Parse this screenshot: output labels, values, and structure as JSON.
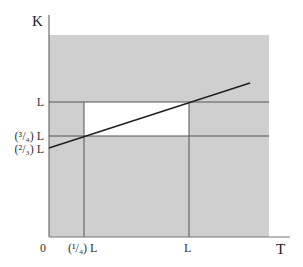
{
  "diagram": {
    "axes": {
      "y_label": "K",
      "x_label": "T",
      "origin_label": "0"
    },
    "y_ticks": [
      {
        "label": "L",
        "y": 102
      },
      {
        "label": "(³/₄) L",
        "y": 136
      },
      {
        "label": "(²/₃) L",
        "y": 148
      }
    ],
    "x_ticks": [
      {
        "label": "(¹/₄) L",
        "x": 84
      },
      {
        "label": "L",
        "x": 189
      }
    ],
    "regions": {
      "shaded_color": "#cfcfcf",
      "white_color": "#ffffff",
      "line_color": "#222222",
      "grid_line_color": "#555555"
    },
    "budget_line": {
      "from": [
        49,
        148
      ],
      "to": [
        250,
        83
      ]
    }
  }
}
